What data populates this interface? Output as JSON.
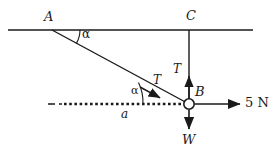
{
  "figure": {
    "background_color": "#ffffff",
    "stroke_color": "#1a1a1a",
    "labels": {
      "point_a": "A",
      "point_c": "C",
      "point_b": "B",
      "angle_at_a": "α",
      "angle_at_b": "α",
      "tension_slant": "T",
      "tension_vertical": "T",
      "weight": "W",
      "acceleration": "a",
      "applied_force": "5 N"
    },
    "geometry": {
      "ceiling_line": {
        "x1": 8,
        "y1": 30,
        "x2": 253,
        "y2": 30
      },
      "slant_string": {
        "x1": 52,
        "y1": 30,
        "x2": 188,
        "y2": 104
      },
      "vertical_string": {
        "x1": 189,
        "y1": 30,
        "x2": 189,
        "y2": 104
      },
      "node_b": {
        "cx": 189,
        "cy": 104,
        "r": 5
      },
      "acceleration_line": {
        "x1": 48,
        "y1": 104,
        "x2": 182,
        "y2": 104
      },
      "force_arrow": {
        "x1": 196,
        "y1": 104,
        "x2": 241,
        "y2": 104
      },
      "weight_arrow": {
        "x1": 189,
        "y1": 110,
        "x2": 189,
        "y2": 131
      },
      "tension_vertical_arrow_tip": {
        "x": 189,
        "y": 75
      },
      "tension_slant_arrow_tip": {
        "x": 158,
        "y": 95
      }
    }
  }
}
